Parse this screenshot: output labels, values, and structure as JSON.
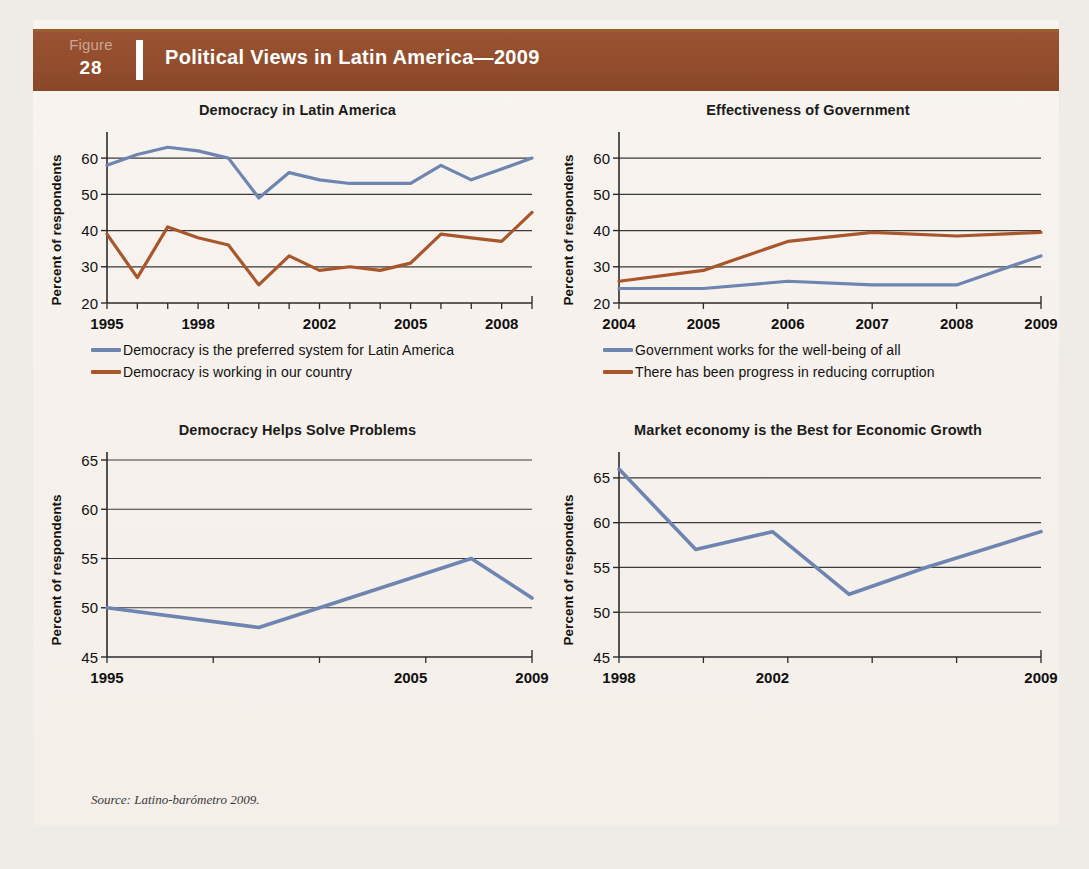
{
  "figure": {
    "label_word": "Figure",
    "number": "28",
    "title": "Political Views in Latin America—2009",
    "source": "Source:  Latino-barómetro 2009.",
    "header_color": "#92512f",
    "page_bg": "#f6f2ed",
    "series_colors": {
      "blue": "#6e85b2",
      "brown": "#a8562c"
    }
  },
  "chart_data": [
    {
      "type": "line",
      "title": "Democracy in Latin America",
      "xlabel": "",
      "ylabel": "Percent of respondents",
      "ylim": [
        20,
        65
      ],
      "yticks": [
        20,
        30,
        40,
        50,
        60
      ],
      "xlim": [
        1995,
        2009
      ],
      "xticks": [
        1995,
        1998,
        2002,
        2005,
        2008
      ],
      "x": [
        1995,
        1996,
        1997,
        1998,
        1999,
        2000,
        2001,
        2002,
        2003,
        2004,
        2005,
        2006,
        2007,
        2008,
        2009
      ],
      "grid": true,
      "legend_position": "below",
      "series": [
        {
          "name": "Democracy is the preferred system for Latin America",
          "color": "#6e85b2",
          "values": [
            58,
            61,
            63,
            62,
            60,
            49,
            56,
            54,
            53,
            53,
            53,
            58,
            54,
            57,
            60
          ]
        },
        {
          "name": "Democracy is working in our country",
          "color": "#a8562c",
          "values": [
            39,
            27,
            41,
            38,
            36,
            25,
            33,
            29,
            30,
            29,
            31,
            39,
            38,
            37,
            45
          ]
        }
      ]
    },
    {
      "type": "line",
      "title": "Effectiveness of Government",
      "xlabel": "",
      "ylabel": "Percent of respondents",
      "ylim": [
        20,
        65
      ],
      "yticks": [
        20,
        30,
        40,
        50,
        60
      ],
      "xlim": [
        2004,
        2009
      ],
      "xticks": [
        2004,
        2005,
        2006,
        2007,
        2008,
        2009
      ],
      "x": [
        2004,
        2005,
        2006,
        2007,
        2008,
        2009
      ],
      "grid": true,
      "legend_position": "below",
      "series": [
        {
          "name": "Government works for the well-being of all",
          "color": "#6e85b2",
          "values": [
            24,
            24,
            26,
            25,
            25,
            33
          ]
        },
        {
          "name": "There has been progress in reducing corruption",
          "color": "#a8562c",
          "values": [
            26,
            29,
            37,
            39.5,
            38.5,
            39.5
          ]
        }
      ]
    },
    {
      "type": "line",
      "title": "Democracy Helps Solve Problems",
      "xlabel": "",
      "ylabel": "Percent of respondents",
      "ylim": [
        45,
        65
      ],
      "yticks": [
        45,
        50,
        55,
        60,
        65
      ],
      "xlim": [
        1995,
        2009
      ],
      "xticks": [
        1995,
        2005,
        2009
      ],
      "x": [
        1995,
        2000,
        2005,
        2007,
        2009
      ],
      "grid": true,
      "legend_position": "none",
      "series": [
        {
          "name": "Democracy helps solve problems",
          "color": "#6e85b2",
          "values": [
            50,
            48,
            53,
            55,
            51
          ]
        }
      ]
    },
    {
      "type": "line",
      "title": "Market economy is the Best for Economic Growth",
      "xlabel": "",
      "ylabel": "Percent of respondents",
      "ylim": [
        45,
        67
      ],
      "yticks": [
        45,
        50,
        55,
        60,
        65
      ],
      "xlim": [
        1998,
        2009
      ],
      "xticks": [
        1998,
        2002,
        2009
      ],
      "x": [
        1998,
        2000,
        2002,
        2004,
        2006,
        2009
      ],
      "grid": true,
      "legend_position": "none",
      "series": [
        {
          "name": "Market economy is the best for economic growth",
          "color": "#6e85b2",
          "values": [
            66,
            57,
            59,
            52,
            55,
            59
          ]
        }
      ]
    }
  ]
}
